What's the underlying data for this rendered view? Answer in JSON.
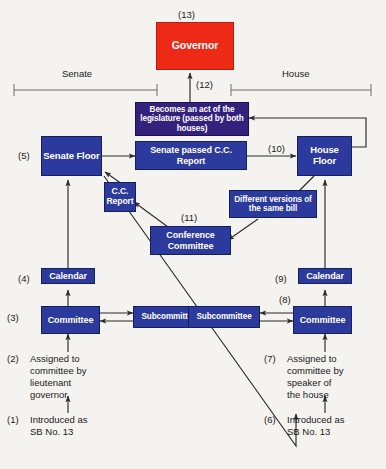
{
  "diagram": {
    "background_color": "#f4f3ef",
    "colors": {
      "blue": "#2b3a9c",
      "purple": "#33217e",
      "red": "#ee2a16",
      "line": "#2b2b2b",
      "bracket": "#6d6d6d",
      "text": "#1a1a1a"
    },
    "brackets": [
      {
        "id": "senate",
        "label": "Senate"
      },
      {
        "id": "house",
        "label": "House"
      }
    ],
    "nodes": {
      "governor": {
        "label": "Governor",
        "number": "(13)",
        "color": "red"
      },
      "becomes_act": {
        "label": "Becomes an act\nof the legislature\n(passed by both houses)",
        "number": "(12)",
        "color": "purple"
      },
      "senate_floor": {
        "label": "Senate\nFloor",
        "number": "(5)",
        "color": "blue"
      },
      "senate_passed": {
        "label": "Senate passed\nC.C. Report",
        "number": "",
        "color": "blue"
      },
      "house_floor": {
        "label": "House\nFloor",
        "number": "(10)",
        "color": "blue"
      },
      "cc_report": {
        "label": "C.C.\nReport",
        "number": "",
        "color": "blue"
      },
      "conference_committee": {
        "label": "Conference\nCommittee",
        "number": "(11)",
        "color": "blue"
      },
      "different_versions": {
        "label": "Different versions\nof the same bill",
        "number": "",
        "color": "blue"
      },
      "senate_calendar": {
        "label": "Calendar",
        "number": "(4)",
        "color": "blue"
      },
      "senate_committee": {
        "label": "Committee",
        "number": "(3)",
        "color": "blue"
      },
      "senate_subcommittee": {
        "label": "Subcommittee",
        "number": "",
        "color": "blue"
      },
      "house_calendar": {
        "label": "Calendar",
        "number": "(9)",
        "color": "blue"
      },
      "house_committee": {
        "label": "Committee",
        "number": "(8)",
        "color": "blue"
      },
      "house_subcommittee": {
        "label": "Subcommittee",
        "number": "",
        "color": "blue"
      }
    },
    "captions": {
      "senate_assigned": {
        "number": "(2)",
        "text": "Assigned to\ncommittee by\nlieutenant\ngovernor"
      },
      "senate_introduced": {
        "number": "(1)",
        "text": "Introduced as\nSB No. 13"
      },
      "house_assigned": {
        "number": "(7)",
        "text": "Assigned to\ncommittee by\nspeaker of\nthe house"
      },
      "house_introduced": {
        "number": "(6)",
        "text": "Introduced as\nSB No. 13"
      }
    }
  }
}
